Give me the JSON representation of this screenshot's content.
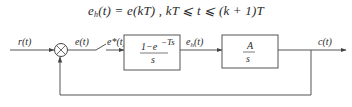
{
  "equation": {
    "lhs_symbol": "e",
    "lhs_subscript": "h",
    "lhs_arg": "(t) = e(kT) ,  kT ⩽ t ⩽ (k + 1)T"
  },
  "diagram": {
    "input_label": "r(t)",
    "error_label": "e(t)",
    "sampled_label": "e*(t)",
    "hold_output_label": "e",
    "hold_output_subscript": "h",
    "hold_output_arg": "(t)",
    "output_label": "c(t)",
    "summing_junction": "⊗",
    "block_hold": {
      "numerator": "1−e",
      "numerator_exponent": "−Ts",
      "denominator": "s"
    },
    "block_plant": {
      "numerator": "A",
      "denominator": "s"
    }
  }
}
